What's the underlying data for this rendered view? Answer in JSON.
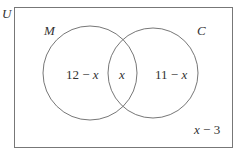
{
  "diagram": {
    "type": "venn",
    "universe_label": "U",
    "sets": [
      {
        "name": "M",
        "label": "M"
      },
      {
        "name": "C",
        "label": "C"
      }
    ],
    "regions": {
      "only_M": {
        "num": "12",
        "op": " − ",
        "var": "x"
      },
      "intersection": {
        "var": "x"
      },
      "only_C": {
        "num": "11",
        "op": " − ",
        "var": "x"
      },
      "outside": {
        "var": "x",
        "op": " − ",
        "num": "3"
      }
    },
    "colors": {
      "stroke": "#666666",
      "text": "#333333",
      "background": "#ffffff"
    }
  }
}
